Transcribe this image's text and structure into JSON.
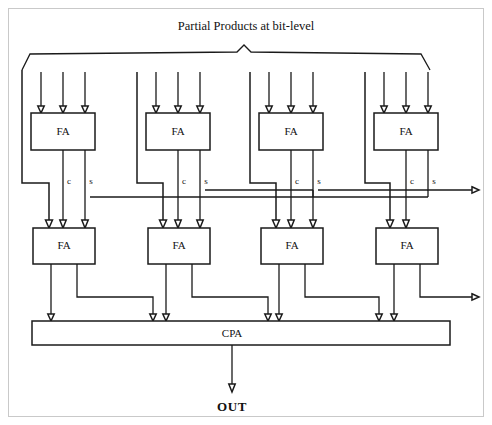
{
  "figure": {
    "title": "Partial Products at bit-level",
    "output_label": "OUT",
    "cpa_label": "CPA",
    "fa_label": "FA",
    "carry_label": "c",
    "sum_label": "s",
    "colors": {
      "wire": "#1a1a1a",
      "box_fill": "#ffffff",
      "frame": "#c9c9c9",
      "text": "#111111"
    }
  },
  "blocks": {
    "row1": [
      {
        "id": "fa-r1-c1",
        "label": "FA"
      },
      {
        "id": "fa-r1-c2",
        "label": "FA"
      },
      {
        "id": "fa-r1-c3",
        "label": "FA"
      },
      {
        "id": "fa-r1-c4",
        "label": "FA"
      }
    ],
    "row2": [
      {
        "id": "fa-r2-c1",
        "label": "FA"
      },
      {
        "id": "fa-r2-c2",
        "label": "FA"
      },
      {
        "id": "fa-r2-c3",
        "label": "FA"
      },
      {
        "id": "fa-r2-c4",
        "label": "FA"
      }
    ],
    "cpa": {
      "id": "cpa-block",
      "label": "CPA"
    }
  },
  "signal_labels": {
    "row1_group1": {
      "carry": "c",
      "sum": "s"
    },
    "row1_group2": {
      "carry": "c",
      "sum": "s"
    },
    "row1_group3": {
      "carry": "c",
      "sum": "s"
    },
    "row1_group4": {
      "carry": "c",
      "sum": "s"
    }
  }
}
